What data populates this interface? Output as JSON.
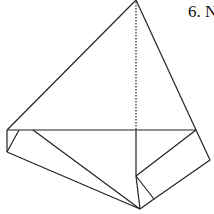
{
  "figure": {
    "label": "6. N",
    "stroke_color": "#222222",
    "background": "#ffffff"
  }
}
